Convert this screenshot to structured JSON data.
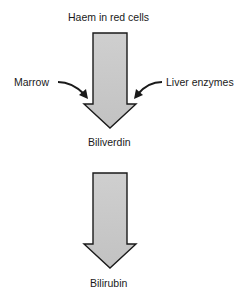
{
  "diagram": {
    "top_label": "Haem in red cells",
    "left_input": "Marrow",
    "right_input": "Liver enzymes",
    "middle_label": "Biliverdin",
    "bottom_label": "Bilirubin",
    "colors": {
      "arrow_fill": "#c8c8c8",
      "arrow_stroke": "#1a1a1a",
      "text": "#1a1a1a"
    }
  }
}
